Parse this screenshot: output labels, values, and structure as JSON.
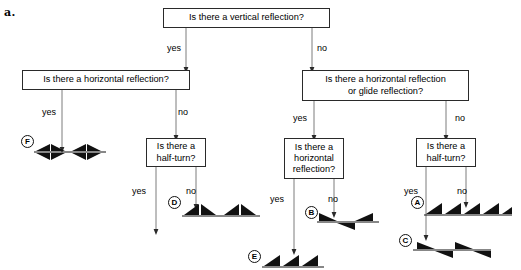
{
  "figure": {
    "part_label": "a.",
    "type": "decision-flowchart"
  },
  "nodes": [
    {
      "id": "q-vertical-reflection",
      "text": "Is there a vertical reflection?",
      "x": 163,
      "y": 8,
      "w": 167,
      "h": 20
    },
    {
      "id": "q-horizontal-reflection-left",
      "text": "Is there a horizontal reflection?",
      "x": 22,
      "y": 70,
      "w": 168,
      "h": 20
    },
    {
      "id": "q-horizontal-or-glide",
      "text": "Is there a horizontal reflection\nor glide reflection?",
      "x": 302,
      "y": 70,
      "w": 167,
      "h": 31
    },
    {
      "id": "q-half-turn-left",
      "text": "Is there a\nhalf-turn?",
      "x": 146,
      "y": 138,
      "w": 60,
      "h": 29
    },
    {
      "id": "q-horizontal-reflection-mid",
      "text": "Is there a\nhorizontal\nreflection?",
      "x": 284,
      "y": 138,
      "w": 60,
      "h": 41
    },
    {
      "id": "q-half-turn-right",
      "text": "Is there a\nhalf-turn?",
      "x": 416,
      "y": 138,
      "w": 60,
      "h": 29
    }
  ],
  "edge_labels": [
    {
      "id": "yes-vertical",
      "text": "yes",
      "x": 167,
      "y": 43
    },
    {
      "id": "no-vertical",
      "text": "no",
      "x": 317,
      "y": 43
    },
    {
      "id": "yes-horizontal-left",
      "text": "yes",
      "x": 42,
      "y": 107
    },
    {
      "id": "no-horizontal-left",
      "text": "no",
      "x": 178,
      "y": 107
    },
    {
      "id": "yes-horizontal-or-glide",
      "text": "yes",
      "x": 293,
      "y": 113
    },
    {
      "id": "no-horizontal-or-glide",
      "text": "no",
      "x": 455,
      "y": 113
    },
    {
      "id": "yes-half-turn-left",
      "text": "yes",
      "x": 132,
      "y": 186
    },
    {
      "id": "no-half-turn-left",
      "text": "no",
      "x": 186,
      "y": 186
    },
    {
      "id": "yes-horizontal-mid",
      "text": "yes",
      "x": 270,
      "y": 194
    },
    {
      "id": "no-horizontal-mid",
      "text": "no",
      "x": 328,
      "y": 194
    },
    {
      "id": "yes-half-turn-right",
      "text": "yes",
      "x": 404,
      "y": 186
    },
    {
      "id": "no-half-turn-right",
      "text": "no",
      "x": 457,
      "y": 186
    }
  ],
  "results": [
    {
      "id": "result-F",
      "label": "F",
      "pattern": "bowtie-four-way",
      "circle_x": 21,
      "circle_y": 135,
      "pattern_x": 34,
      "pattern_y": 139,
      "pattern_w": 72,
      "pattern_h": 26
    },
    {
      "id": "result-D",
      "label": "D",
      "pattern": "paired-triangles-on-line",
      "circle_x": 168,
      "circle_y": 196,
      "pattern_x": 182,
      "pattern_y": 200,
      "pattern_w": 78,
      "pattern_h": 20
    },
    {
      "id": "result-E",
      "label": "E",
      "pattern": "right-triangles-row",
      "circle_x": 248,
      "circle_y": 250,
      "pattern_x": 262,
      "pattern_y": 252,
      "pattern_w": 62,
      "pattern_h": 16
    },
    {
      "id": "result-B",
      "label": "B",
      "pattern": "glide-triangles-opposed",
      "circle_x": 305,
      "circle_y": 206,
      "pattern_x": 317,
      "pattern_y": 209,
      "pattern_w": 62,
      "pattern_h": 24
    },
    {
      "id": "result-A",
      "label": "A",
      "pattern": "right-triangles-row-long",
      "circle_x": 411,
      "circle_y": 196,
      "pattern_x": 424,
      "pattern_y": 199,
      "pattern_w": 88,
      "pattern_h": 20
    },
    {
      "id": "result-C",
      "label": "C",
      "pattern": "glide-triangles-alternating",
      "circle_x": 399,
      "circle_y": 234,
      "pattern_x": 413,
      "pattern_y": 236,
      "pattern_w": 78,
      "pattern_h": 26
    }
  ],
  "colors": {
    "line": "#2a2a2a",
    "fill": "#111111",
    "background": "#ffffff"
  }
}
